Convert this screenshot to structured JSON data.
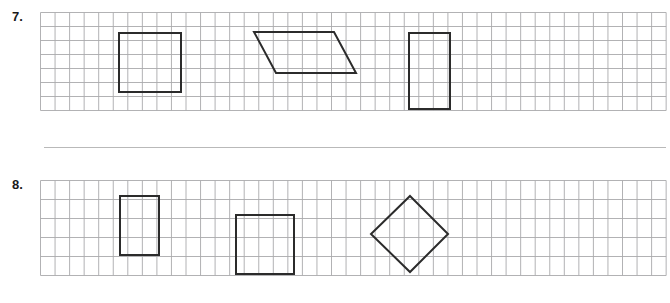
{
  "page": {
    "background_color": "#ffffff",
    "width": 670,
    "height": 303
  },
  "divider": {
    "name": "section-divider",
    "x": 44,
    "y": 147,
    "width": 622,
    "height": 1,
    "color": "#b9b9b9"
  },
  "grid_style": {
    "line_color": "#a9a9ab",
    "line_width": 0.9,
    "cell_size": 14.6,
    "shape_stroke_color": "#2b2b2b",
    "shape_stroke_width": 2.0
  },
  "problems": [
    {
      "label": "7.",
      "label_x": 12,
      "label_y": 9,
      "grid": {
        "x": 40,
        "y": 12,
        "cols": 43,
        "rows": 7,
        "cell_w": 14.55,
        "cell_h": 14.0
      },
      "shapes": [
        {
          "name": "square",
          "type": "polygon",
          "points": "119,33 181,33 181,92 119,92",
          "width_cells": 4,
          "height_cells": 4
        },
        {
          "name": "parallelogram",
          "type": "polygon",
          "points": "254,32 334,32 356,73 276,73",
          "base_cells": 5.5,
          "height_cells": 3
        },
        {
          "name": "rectangle",
          "type": "polygon",
          "points": "409,33 450,33 450,109 409,109",
          "width_cells": 3,
          "height_cells": 5
        }
      ]
    },
    {
      "label": "8.",
      "label_x": 12,
      "label_y": 177,
      "grid": {
        "x": 40,
        "y": 180,
        "cols": 43,
        "rows": 5,
        "cell_w": 14.55,
        "cell_h": 19.0
      },
      "shapes": [
        {
          "name": "rectangle",
          "type": "polygon",
          "points": "120,196 159,196 159,255 120,255",
          "width_cells": 2.7,
          "height_cells": 3
        },
        {
          "name": "square",
          "type": "polygon",
          "points": "236,215 294,215 294,274 236,274",
          "width_cells": 4,
          "height_cells": 3
        },
        {
          "name": "diamond",
          "type": "polygon",
          "points": "410,196 448,234 410,272 371,234",
          "diagonal_cells": 5.3
        }
      ]
    }
  ]
}
